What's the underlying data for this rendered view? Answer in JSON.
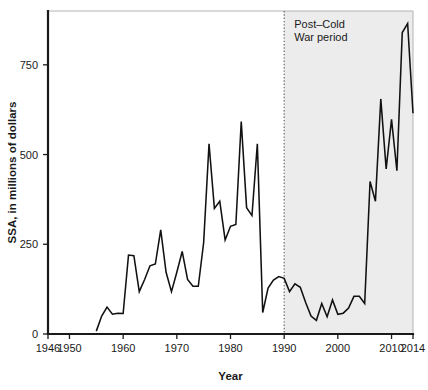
{
  "chart_data": {
    "type": "line",
    "title": "",
    "xlabel": "Year",
    "ylabel": "SSA, in millions of dollars",
    "xlim": [
      1946,
      2014
    ],
    "ylim": [
      0,
      900
    ],
    "xticks": [
      1946,
      1950,
      1960,
      1970,
      1980,
      1990,
      2000,
      2010,
      2014
    ],
    "xtick_labels": [
      "1946",
      "1950",
      "1960",
      "1970",
      "1980",
      "1990",
      "2000",
      "2010",
      "2014"
    ],
    "yticks": [
      0,
      250,
      500,
      750
    ],
    "ytick_labels": [
      "0",
      "250",
      "500",
      "750"
    ],
    "grid": false,
    "legend": "none",
    "line_color": "#111111",
    "shaded_region": {
      "label_line1": "Post–Cold",
      "label_line2": "War period",
      "x_start": 1990,
      "x_end": 2014,
      "color": "#ececec",
      "divider_x": 1990
    },
    "x": [
      1955,
      1956,
      1957,
      1958,
      1959,
      1960,
      1961,
      1962,
      1963,
      1964,
      1965,
      1966,
      1967,
      1968,
      1969,
      1970,
      1971,
      1972,
      1973,
      1974,
      1975,
      1976,
      1977,
      1978,
      1979,
      1980,
      1981,
      1982,
      1983,
      1984,
      1985,
      1986,
      1987,
      1988,
      1989,
      1990,
      1991,
      1992,
      1993,
      1994,
      1995,
      1996,
      1997,
      1998,
      1999,
      2000,
      2001,
      2002,
      2003,
      2004,
      2005,
      2006,
      2007,
      2008,
      2009,
      2010,
      2011,
      2012,
      2013,
      2014
    ],
    "values": [
      8,
      50,
      75,
      55,
      58,
      57,
      220,
      218,
      118,
      152,
      190,
      195,
      290,
      172,
      118,
      172,
      230,
      152,
      133,
      133,
      255,
      530,
      350,
      370,
      262,
      300,
      305,
      592,
      352,
      330,
      530,
      60,
      128,
      150,
      160,
      155,
      118,
      140,
      130,
      88,
      50,
      38,
      85,
      48,
      95,
      55,
      58,
      72,
      105,
      105,
      85,
      425,
      370,
      655,
      460,
      598,
      455,
      840,
      865,
      615
    ]
  },
  "figure": {
    "plot_left_px": 48,
    "plot_right_px": 413,
    "plot_top_px": 11,
    "plot_bottom_px": 334
  }
}
